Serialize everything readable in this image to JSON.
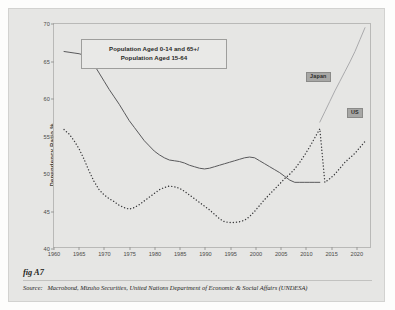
{
  "figure": {
    "fig_label": "fig A7",
    "source_prefix": "Source:",
    "source_text": "Macrobond, Mizuho Securities, United Nations Department of Economic & Social Affairs (UNDESA)"
  },
  "colors": {
    "panel_background": "#e6e6e4",
    "page_background": "#fdfdfc",
    "axis": "#b9b9b7",
    "japan_history": "#58585a",
    "japan_projection": "#a9a9ab",
    "us_series": "#3c3c3e",
    "badge_background": "#a7a7a5",
    "text": "#2a2a28"
  },
  "chart_data": {
    "type": "line",
    "title": "Population Aged 0-14 and 65+/ Population Aged 15-64",
    "title_line1": "Population Aged 0-14 and 65+/",
    "title_line2": "Population Aged 15-64",
    "xlabel": "",
    "ylabel": "Dependency Ratio %",
    "xlim": [
      1960,
      2023
    ],
    "ylim": [
      40,
      70
    ],
    "yticks": [
      40,
      45,
      50,
      55,
      60,
      65,
      70
    ],
    "xticks": [
      1960,
      1965,
      1970,
      1975,
      1980,
      1985,
      1990,
      1995,
      2000,
      2005,
      2010,
      2015,
      2020
    ],
    "grid": false,
    "legend_position": "inline-labels",
    "series": [
      {
        "name": "Japan",
        "style": "solid",
        "label": "Japan",
        "x": [
          1962,
          1963,
          1964,
          1965,
          1966,
          1967,
          1968,
          1969,
          1970,
          1971,
          1972,
          1973,
          1974,
          1975,
          1976,
          1977,
          1978,
          1979,
          1980,
          1981,
          1982,
          1983,
          1984,
          1985,
          1986,
          1987,
          1988,
          1989,
          1990,
          1991,
          1992,
          1993,
          1994,
          1995,
          1996,
          1997,
          1998,
          1999,
          2000,
          2001,
          2002,
          2003,
          2004,
          2005,
          2006,
          2007,
          2008,
          2009,
          2010,
          2011,
          2012,
          2013
        ],
        "values": [
          66.3,
          66.2,
          66.1,
          66.0,
          65.8,
          65.6,
          64.5,
          63.4,
          62.3,
          61.2,
          60.2,
          59.2,
          58.1,
          57.0,
          56.1,
          55.2,
          54.3,
          53.6,
          52.9,
          52.4,
          52.0,
          51.7,
          51.6,
          51.5,
          51.3,
          51.0,
          50.8,
          50.6,
          50.5,
          50.6,
          50.8,
          51.0,
          51.2,
          51.4,
          51.6,
          51.8,
          52.0,
          52.1,
          52.0,
          51.6,
          51.2,
          50.8,
          50.4,
          50.0,
          49.5,
          49.0,
          48.7,
          48.7,
          48.7,
          48.7,
          48.7,
          48.7
        ]
      },
      {
        "name": "Japan projection",
        "style": "solid-light",
        "label": "",
        "x": [
          2013,
          2014,
          2015,
          2016,
          2017,
          2018,
          2019,
          2020,
          2021,
          2022
        ],
        "values": [
          56.8,
          58.2,
          59.6,
          61.0,
          62.3,
          63.6,
          64.9,
          66.3,
          67.9,
          69.5
        ]
      },
      {
        "name": "US",
        "style": "dotted",
        "label": "US",
        "x": [
          1962,
          1963,
          1964,
          1965,
          1966,
          1967,
          1968,
          1969,
          1970,
          1971,
          1972,
          1973,
          1974,
          1975,
          1976,
          1977,
          1978,
          1979,
          1980,
          1981,
          1982,
          1983,
          1984,
          1985,
          1986,
          1987,
          1988,
          1989,
          1990,
          1991,
          1992,
          1993,
          1994,
          1995,
          1996,
          1997,
          1998,
          1999,
          2000,
          2001,
          2002,
          2003,
          2004,
          2005,
          2006,
          2007,
          2008,
          2009,
          2010,
          2011,
          2012,
          2013,
          2014,
          2015,
          2016,
          2017,
          2018,
          2019,
          2020,
          2021,
          2022
        ],
        "values": [
          55.8,
          55.2,
          54.3,
          53.2,
          51.8,
          50.2,
          48.8,
          47.7,
          47.0,
          46.5,
          46.1,
          45.6,
          45.3,
          45.1,
          45.3,
          45.7,
          46.2,
          46.7,
          47.2,
          47.7,
          48.0,
          48.2,
          48.1,
          47.9,
          47.5,
          47.0,
          46.5,
          46.0,
          45.5,
          45.0,
          44.4,
          43.8,
          43.4,
          43.3,
          43.3,
          43.4,
          43.6,
          44.1,
          44.8,
          45.6,
          46.4,
          47.1,
          47.8,
          48.5,
          49.2,
          49.8,
          50.5,
          51.4,
          52.4,
          53.5,
          54.7,
          55.9,
          48.7,
          49.2,
          49.8,
          50.6,
          51.4,
          52.0,
          52.6,
          53.4,
          54.2
        ]
      }
    ]
  }
}
